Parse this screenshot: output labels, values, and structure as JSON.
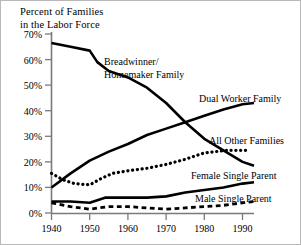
{
  "chart_data": {
    "type": "line",
    "title": "Percent of Families\nin the Labor Force",
    "title_line1": "Percent of Families",
    "title_line2": "in the Labor Force",
    "xlabel": "",
    "ylabel": "Percent of Families in the Labor Force",
    "xlim": [
      1940,
      1993
    ],
    "ylim": [
      0,
      70
    ],
    "grid": false,
    "legend_position": "inline-annotations",
    "x_tick_labels": [
      "1940",
      "1950",
      "1960",
      "1970",
      "1980",
      "1990"
    ],
    "x_ticks": [
      1940,
      1950,
      1960,
      1970,
      1980,
      1990
    ],
    "y_tick_labels": [
      "0%",
      "10%",
      "20%",
      "30%",
      "40%",
      "50%",
      "60%",
      "70%"
    ],
    "y_ticks": [
      0,
      10,
      20,
      30,
      40,
      50,
      60,
      70
    ],
    "series": [
      {
        "name": "Breadwinner/Homemaker Family",
        "label_line1": "Breadwinner/",
        "label_line2": "Homemaker Family",
        "style": "solid",
        "color": "#000000",
        "x": [
          1940,
          1945,
          1950,
          1952,
          1955,
          1960,
          1965,
          1970,
          1975,
          1980,
          1985,
          1990,
          1993
        ],
        "values": [
          66.5,
          65.0,
          63.5,
          59.0,
          55.5,
          53.0,
          49.0,
          43.0,
          35.5,
          29.0,
          24.5,
          20.0,
          18.5
        ]
      },
      {
        "name": "Dual Worker Family",
        "label_line1": "Dual Worker Family",
        "style": "solid",
        "color": "#000000",
        "x": [
          1940,
          1945,
          1950,
          1955,
          1960,
          1965,
          1970,
          1975,
          1980,
          1985,
          1990,
          1993
        ],
        "values": [
          10.0,
          15.5,
          20.5,
          24.0,
          27.0,
          30.5,
          33.0,
          35.5,
          38.0,
          40.5,
          42.5,
          43.0
        ]
      },
      {
        "name": "All Other Families",
        "label_line1": "All Other Families",
        "style": "dotted",
        "color": "#000000",
        "x": [
          1940,
          1943,
          1946,
          1950,
          1953,
          1956,
          1960,
          1965,
          1970,
          1975,
          1980,
          1983,
          1986,
          1990,
          1992
        ],
        "values": [
          15.5,
          13.0,
          11.5,
          11.0,
          13.5,
          15.5,
          16.5,
          17.5,
          19.0,
          21.0,
          23.5,
          24.0,
          24.5,
          24.5,
          24.5
        ]
      },
      {
        "name": "Female Single Parent",
        "label_line1": "Female Single Parent",
        "style": "solid",
        "color": "#000000",
        "x": [
          1940,
          1945,
          1950,
          1954,
          1960,
          1965,
          1970,
          1975,
          1980,
          1985,
          1990,
          1993
        ],
        "values": [
          4.5,
          4.5,
          4.0,
          6.0,
          6.0,
          6.0,
          6.5,
          8.0,
          9.0,
          10.0,
          11.5,
          12.0
        ]
      },
      {
        "name": "Male Single Parent",
        "label_line1": "Male Single Parent",
        "style": "dashed",
        "color": "#000000",
        "x": [
          1940,
          1945,
          1950,
          1955,
          1960,
          1965,
          1970,
          1975,
          1980,
          1985,
          1990,
          1993
        ],
        "values": [
          4.0,
          2.5,
          1.5,
          2.5,
          2.5,
          2.0,
          1.5,
          2.0,
          2.5,
          3.0,
          4.0,
          4.5
        ]
      }
    ],
    "annotations": [
      {
        "text": "Breadwinner/",
        "x": 1958,
        "y": 61
      },
      {
        "text": "Homemaker Family",
        "x": 1958,
        "y": 56
      },
      {
        "text": "Dual Worker Family",
        "x": 1979,
        "y": 44
      },
      {
        "text": "All Other Families",
        "x": 1981,
        "y": 29
      },
      {
        "text": "Female Single Parent",
        "x": 1975,
        "y": 15
      },
      {
        "text": "Male Single Parent",
        "x": 1977,
        "y": 8
      }
    ]
  },
  "axis": {
    "axis_color": "#7a7a7a",
    "line_color": "#000000"
  }
}
